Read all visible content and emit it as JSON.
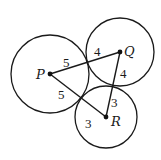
{
  "diagram": {
    "type": "geometry",
    "circles": [
      {
        "center": "P",
        "cx": 50,
        "cy": 74,
        "r": 39,
        "radius_value": 5
      },
      {
        "center": "Q",
        "cx": 120,
        "cy": 52,
        "r": 34,
        "radius_value": 4
      },
      {
        "center": "R",
        "cx": 106,
        "cy": 117,
        "r": 31,
        "radius_value": 3
      }
    ],
    "points": {
      "P": {
        "label": "P",
        "x": 50,
        "y": 74
      },
      "Q": {
        "label": "Q",
        "x": 120,
        "y": 52
      },
      "R": {
        "label": "R",
        "x": 106,
        "y": 117
      }
    },
    "segments": [
      {
        "from": "P",
        "to": "Q",
        "labels": [
          "5",
          "4"
        ]
      },
      {
        "from": "P",
        "to": "R",
        "labels": [
          "5",
          "3"
        ]
      },
      {
        "from": "Q",
        "to": "R",
        "labels": [
          "4",
          "3"
        ]
      }
    ],
    "segment_labels": {
      "pq_p": "5",
      "pq_q": "4",
      "pr_p": "5",
      "pr_r": "3",
      "qr_q": "4",
      "qr_r": "3"
    },
    "colors": {
      "stroke": "#1a1a1a",
      "background": "#ffffff"
    }
  }
}
